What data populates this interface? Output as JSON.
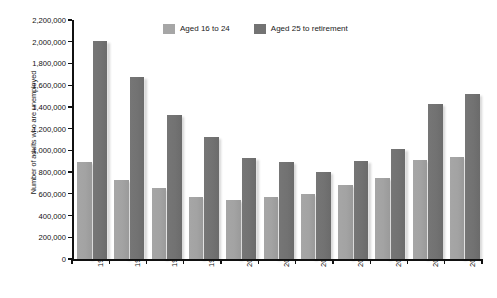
{
  "chart_data": {
    "type": "bar",
    "title": "",
    "subtitle": "",
    "xlabel": "",
    "ylabel": "Number of adults who are unemployed",
    "ylim": [
      0,
      2200000
    ],
    "ytick_step": 200000,
    "ytick_labels": [
      "0",
      "200,000",
      "400,000",
      "600,000",
      "800,000",
      "1,000,000",
      "1,200,000",
      "1,400,000",
      "1,600,000",
      "1,800,000",
      "2,000,000",
      "2,200,000"
    ],
    "ytick_values": [
      0,
      200000,
      400000,
      600000,
      800000,
      1000000,
      1200000,
      1400000,
      1600000,
      1800000,
      2000000,
      2200000
    ],
    "categories": [
      "1993",
      "1995",
      "1997",
      "1999",
      "2001",
      "2003",
      "2005",
      "2007",
      "2008",
      "2009",
      "2010"
    ],
    "grid": false,
    "legend_position": "top-center",
    "series": [
      {
        "name": "Aged 16 to 24",
        "color": "#a6a6a6",
        "values": [
          890000,
          730000,
          650000,
          570000,
          540000,
          570000,
          600000,
          680000,
          745000,
          915000,
          935000
        ]
      },
      {
        "name": "Aged 25 to retirement",
        "color": "#737373",
        "values": [
          2010000,
          1680000,
          1330000,
          1120000,
          930000,
          890000,
          800000,
          900000,
          1010000,
          1430000,
          1520000
        ]
      }
    ]
  },
  "legend": {
    "items": [
      {
        "label": "Aged 16 to 24"
      },
      {
        "label": "Aged 25 to retirement"
      }
    ]
  },
  "axes": {
    "y_title": "Number of adults who are unemployed"
  }
}
